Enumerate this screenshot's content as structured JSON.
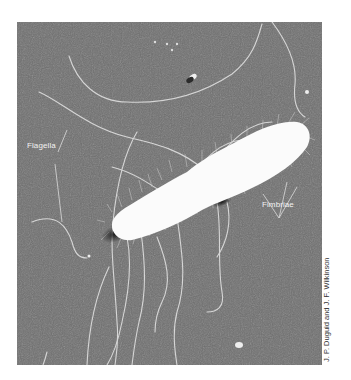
{
  "figure": {
    "labels": {
      "flagella": "Flagella",
      "fimbriae": "Fimbriae"
    },
    "credit": "J. P. Duguid and J. F. Wilkinson",
    "colors": {
      "background": "#6e6e6e",
      "cell": "#ffffff",
      "filaments": "#d8d8d8",
      "label_text": "#f2f2f2"
    }
  }
}
